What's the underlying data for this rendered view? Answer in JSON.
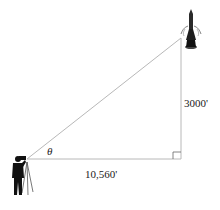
{
  "diagram": {
    "type": "right-triangle-word-problem",
    "labels": {
      "angle": "θ",
      "height": "3000'",
      "base": "10,560'"
    },
    "objects": {
      "top": "rocket",
      "bottom_left": "observer-with-tripod"
    },
    "colors": {
      "line": "#b8b8b8",
      "figure": "#1a1a1a",
      "background": "#ffffff"
    }
  }
}
